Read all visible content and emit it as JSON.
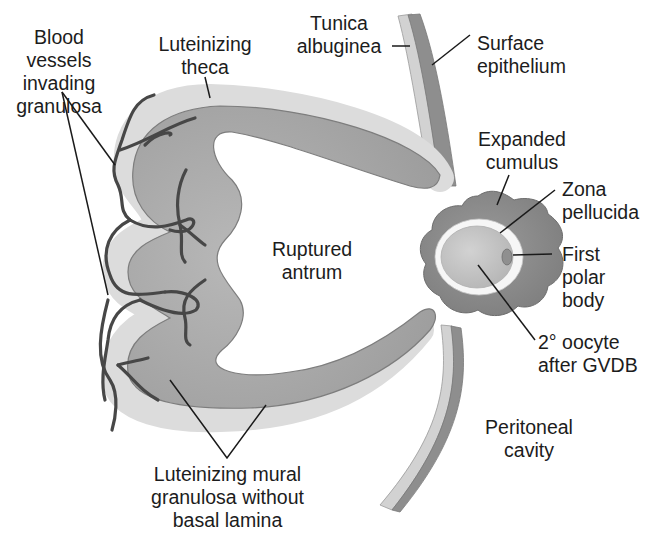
{
  "diagram": {
    "labels": {
      "blood_vessels": [
        "Blood",
        "vessels",
        "invading",
        "granulosa"
      ],
      "luteinizing_theca": [
        "Luteinizing",
        "theca"
      ],
      "tunica_albuginea": [
        "Tunica",
        "albuginea"
      ],
      "surface_epithelium": [
        "Surface",
        "epithelium"
      ],
      "expanded_cumulus": [
        "Expanded",
        "cumulus"
      ],
      "zona_pellucida": [
        "Zona",
        "pellucida"
      ],
      "first_polar_body": [
        "First",
        "polar",
        "body"
      ],
      "ruptured_antrum": [
        "Ruptured",
        "antrum"
      ],
      "secondary_oocyte": [
        "2° oocyte",
        "after GVDB"
      ],
      "peritoneal_cavity": [
        "Peritoneal",
        "cavity"
      ],
      "mural_granulosa": [
        "Luteinizing mural",
        "granulosa without",
        "basal lamina"
      ]
    },
    "colors": {
      "granulosa": "#a9a9a9",
      "theca": "#d9d9d9",
      "surface_epithelium": "#8e8e8e",
      "tunica_albuginea": "#cfcfcf",
      "cumulus": "#8a8a8a",
      "zona": "#f4f4f4",
      "oocyte": "#c4c4c4",
      "polar_body": "#909090",
      "vessel": "#4a4a4a",
      "leader_line": "#1a1a1a"
    }
  }
}
